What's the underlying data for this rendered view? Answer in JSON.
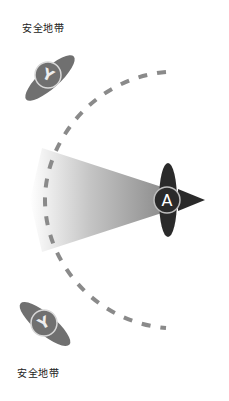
{
  "labels": {
    "top": "安全地带",
    "bottom": "安全地带"
  },
  "players": {
    "attacker": {
      "letter": "A",
      "color": "#2a2a2a",
      "direction": "right"
    },
    "defender_top": {
      "letter": "Y",
      "color": "#707070"
    },
    "defender_bottom": {
      "letter": "Y",
      "color": "#707070"
    }
  },
  "zones": {
    "arc": {
      "style": "dashed",
      "color": "#8a8a8a"
    },
    "cone": {
      "gradient_from": "#9a9a9a",
      "gradient_to": "#ffffff"
    }
  }
}
